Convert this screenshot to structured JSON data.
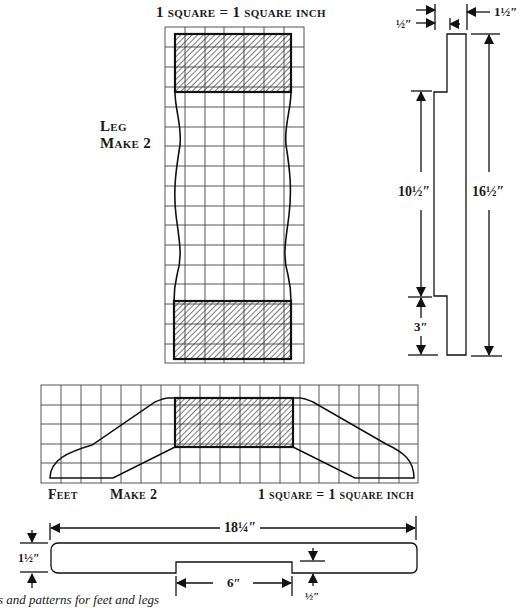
{
  "leg_pattern": {
    "scale_label": "1 square = 1 square inch",
    "title_line1": "Leg",
    "title_line2": "Make 2",
    "grid": {
      "columns": 7,
      "rows": 17
    }
  },
  "leg_profile": {
    "dims": {
      "notch_depth": "½″",
      "thickness": "1½″",
      "upper_length": "10½″",
      "total_length": "16½″",
      "lower_length": "3″"
    }
  },
  "feet_pattern": {
    "title": "Feet",
    "make_label": "Make 2",
    "scale_label": "1 square = 1 square inch",
    "grid": {
      "columns": 19,
      "rows": 5
    }
  },
  "feet_profile": {
    "dims": {
      "length": "18¼″",
      "height": "1½″",
      "notch_width": "6″",
      "notch_depth": "½″"
    }
  },
  "caption": "s and patterns for feet and legs"
}
